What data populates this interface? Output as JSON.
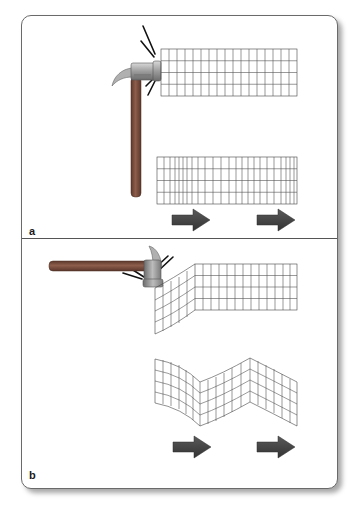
{
  "figure": {
    "panels": [
      {
        "id": "a",
        "label": "a",
        "description": "Hammer strikes end of block horizontally, producing compressional (longitudinal) wave",
        "grid_undisturbed": {
          "columns": 17,
          "rows": 4
        },
        "grid_propagating": {
          "columns": 22,
          "rows": 4,
          "pattern": "alternating compression and rarefaction"
        },
        "arrows": 2
      },
      {
        "id": "b",
        "label": "b",
        "description": "Hammer strikes top of block vertically, producing shear (transverse) wave",
        "grid_undisturbed": {
          "columns": 13,
          "rows": 4,
          "deformed_columns": 5
        },
        "grid_propagating": {
          "columns": 17,
          "rows": 4,
          "pattern": "zigzag shear deformation"
        },
        "arrows": 2
      }
    ],
    "colors": {
      "arrow_fill": "#4a4a4a",
      "grid_line": "#555555",
      "hammer_head": "#a8a8a8",
      "hammer_handle": "#7a4f3e",
      "border": "#6a6a6a"
    }
  }
}
